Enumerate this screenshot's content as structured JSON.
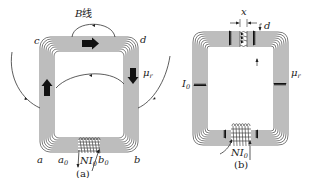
{
  "figures": [
    {
      "id": "a",
      "caption": "(a)",
      "title_label": "B线",
      "title_label_italic_part": "B",
      "title_label_rest": "线",
      "corner_labels": {
        "top_left": "c",
        "top_right": "d",
        "bottom_left": "a",
        "bottom_right": "b"
      },
      "coil_labels": {
        "left": "a",
        "left_sub": "0",
        "right": "b",
        "right_sub": "0"
      },
      "excitation_label": "NI",
      "excitation_sub": "0",
      "permeability_label": "μ",
      "permeability_sub": "r",
      "field_line_count": 7,
      "flux_arrows": [
        "right (top)",
        "down (right)",
        "up (left)"
      ]
    },
    {
      "id": "b",
      "caption": "(b)",
      "gap_label": "x",
      "thickness_label": "d",
      "current_label": "I",
      "current_sub": "0",
      "excitation_label": "NI",
      "excitation_sub": "0",
      "permeability_label": "μ",
      "permeability_sub": "r",
      "field_line_count": 7
    }
  ],
  "colors": {
    "line": "#444444",
    "arrow": "#111111",
    "text": "#222222",
    "background": "#ffffff"
  }
}
